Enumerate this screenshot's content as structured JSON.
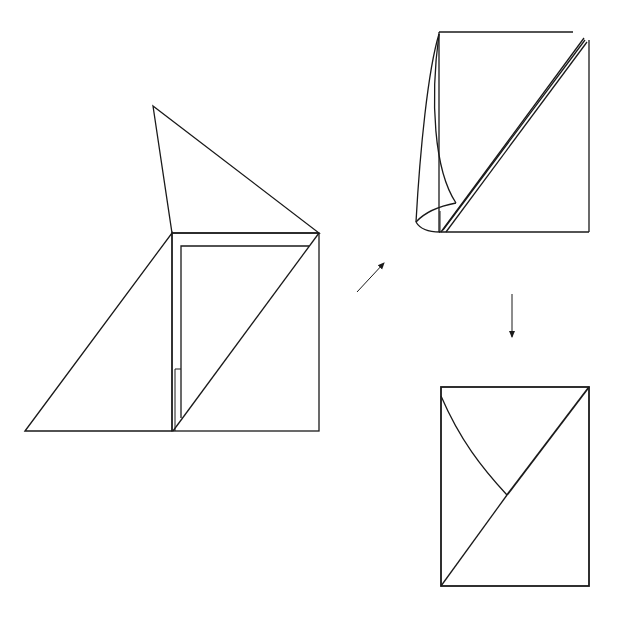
{
  "diagram": {
    "type": "origami-folding-steps",
    "background": "#ffffff",
    "line_color": "#1a1a1a",
    "steps": [
      {
        "id": "step-1",
        "description": "Square with left triangle flap unfolded and top triangle flap raised; inner nested rectangle with diagonal fold",
        "shapes": {
          "top_flap": [
            [
              153,
              106
            ],
            [
              172,
              233
            ],
            [
              319,
              233
            ]
          ],
          "left_flap": [
            [
              25,
              431
            ],
            [
              172,
              233
            ],
            [
              172,
              431
            ]
          ],
          "square": [
            [
              172,
              233
            ],
            [
              319,
              233
            ],
            [
              319,
              431
            ],
            [
              172,
              431
            ]
          ],
          "inner_layer": [
            [
              181,
              418
            ],
            [
              181,
              246
            ],
            [
              309,
              246
            ]
          ],
          "diagonal": [
            [
              173,
              431
            ],
            [
              319,
              233
            ]
          ],
          "small_flap": [
            [
              175,
              431
            ],
            [
              175,
              369
            ],
            [
              181,
              369
            ]
          ]
        }
      },
      {
        "id": "step-2",
        "description": "Left flap being curled toward the diagonal fold",
        "shapes": {
          "square_top": [
            [
              439,
              32
            ],
            [
              573,
              32
            ]
          ],
          "square_left": [
            [
              439,
              32
            ],
            [
              439,
              232
            ]
          ],
          "square_right": [
            [
              589,
              40
            ],
            [
              589,
              232
            ]
          ],
          "square_bottom": [
            [
              439,
              232
            ],
            [
              589,
              232
            ]
          ],
          "diagonal_double": [
            [
              [
                441,
                232
              ],
              [
                585,
                39
              ]
            ],
            [
              [
                445,
                232
              ],
              [
                587,
                42
              ]
            ]
          ]
        }
      },
      {
        "id": "step-3",
        "description": "Result: rectangle with diagonal and curved fold edge",
        "shapes": {
          "rect": [
            [
              441,
              387
            ],
            [
              589,
              387
            ],
            [
              589,
              586
            ],
            [
              441,
              586
            ]
          ],
          "diagonal": [
            [
              441,
              586
            ],
            [
              589,
              387
            ]
          ],
          "curve_end": [
            507,
            495
          ]
        }
      }
    ],
    "arrows": [
      {
        "id": "arrow-step1-to-step2",
        "from": [
          357,
          292
        ],
        "to": [
          385,
          262
        ],
        "direction": "up-right"
      },
      {
        "id": "arrow-step2-to-step3",
        "from": [
          512,
          294
        ],
        "to": [
          512,
          338
        ],
        "direction": "down"
      }
    ]
  }
}
